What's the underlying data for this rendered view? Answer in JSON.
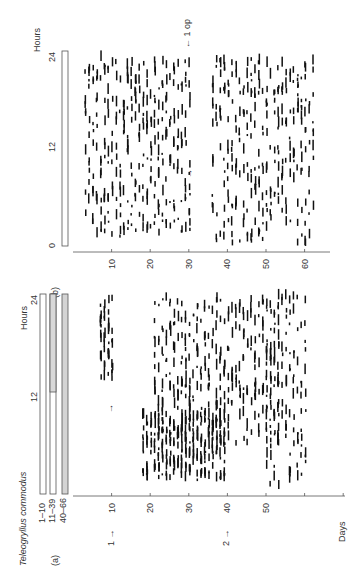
{
  "figure": {
    "species": "Teleogryllus commodus",
    "panel_a": {
      "label": "(a)",
      "hours_label": "Hours",
      "hour_ticks": [
        "12",
        "24"
      ],
      "bar_legend": [
        "1–10",
        "11–39",
        "40–66"
      ],
      "days_label": "Days",
      "day_ticks": [
        "10",
        "20",
        "30",
        "40",
        "50"
      ],
      "markers": [
        {
          "text": "1 →",
          "day": 10
        },
        {
          "text": "2 →",
          "day": 40
        }
      ]
    },
    "panel_b": {
      "label": "(b)",
      "hours_label": "Hours",
      "hour_ticks": [
        "0",
        "12",
        "24"
      ],
      "day_ticks": [
        "10",
        "20",
        "30",
        "40",
        "50",
        "60"
      ],
      "annotation": "← 1 op"
    }
  },
  "chart_data": [
    {
      "type": "scatter",
      "title": "Teleogryllus commodus (a)",
      "xlabel": "Days",
      "ylabel": "Hours",
      "xlim": [
        0,
        66
      ],
      "ylim": [
        0,
        24
      ],
      "legend": [
        "1–10 (LD)",
        "11–39 (LD shifted)",
        "40–66 (DD)"
      ],
      "annotations": [
        "1 → at day 10",
        "2 → at day 40"
      ],
      "bands": [
        {
          "name": "free-run 1",
          "days": [
            7,
            10
          ],
          "hours": [
            13,
            23
          ]
        },
        {
          "name": "triangle",
          "days": [
            18,
            39
          ],
          "hours": [
            1,
            9
          ]
        },
        {
          "name": "drift",
          "days": [
            21,
            53
          ],
          "hours": [
            5,
            23
          ]
        },
        {
          "name": "late band",
          "days": [
            50,
            60
          ],
          "hours": [
            0,
            23
          ]
        }
      ]
    },
    {
      "type": "scatter",
      "title": "(b)",
      "xlabel": "Days",
      "ylabel": "Hours",
      "xlim": [
        0,
        66
      ],
      "ylim": [
        0,
        24
      ],
      "annotations": [
        "← 1 op at day 30"
      ],
      "bands": [
        {
          "name": "pre-op drift",
          "days": [
            3,
            30
          ],
          "hours": [
            1,
            23
          ]
        },
        {
          "name": "post-op arrhythmic",
          "days": [
            36,
            62
          ],
          "hours": [
            0,
            23
          ]
        }
      ]
    }
  ]
}
